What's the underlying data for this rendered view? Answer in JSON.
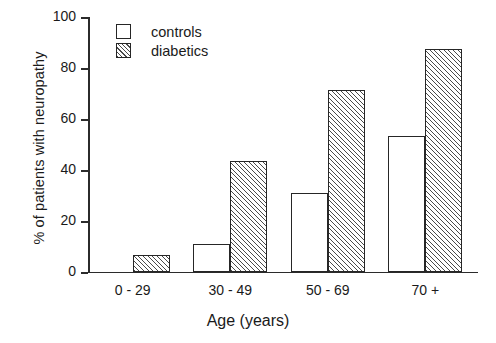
{
  "chart_data": {
    "type": "bar",
    "title": "",
    "xlabel": "Age (years)",
    "ylabel": "% of patients with neuropathy",
    "categories": [
      "0 - 29",
      "30 - 49",
      "50 - 69",
      "70 +"
    ],
    "series": [
      {
        "name": "controls",
        "values": [
          0,
          11,
          31,
          53.5
        ]
      },
      {
        "name": "diabetics",
        "values": [
          6.7,
          43.5,
          71.5,
          87.5
        ]
      }
    ],
    "ylim": [
      0,
      100
    ],
    "yticks": [
      0,
      20,
      40,
      60,
      80,
      100
    ],
    "ytick_labels": [
      "0",
      "20",
      "40",
      "60",
      "80",
      "100"
    ],
    "grid": false,
    "legend_position": "top-left-inside",
    "legend": [
      {
        "label": "controls",
        "swatch": "open-box"
      },
      {
        "label": "diabetics",
        "swatch": "hatched-box"
      }
    ],
    "colors": {
      "axis": "#2b2b2b",
      "bar_outline": "#262626",
      "controls_fill": "#ffffff",
      "diabetics_hatch": "#4a4a4a",
      "background": "#ffffff"
    }
  }
}
